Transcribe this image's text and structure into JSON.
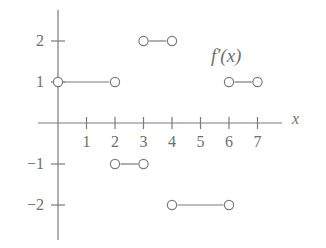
{
  "figure": {
    "background_color": "#ffffff",
    "ink_color": "#7a7a7a",
    "text_color": "#6e6e6e",
    "function_label": "f′(x)",
    "xaxis_label": "x"
  },
  "chart_data": {
    "type": "line",
    "title": "",
    "subtitle": "",
    "xlabel": "x",
    "ylabel": "",
    "legend": [
      "f′(x)"
    ],
    "legend_position": "upper-right-inside",
    "grid": false,
    "xlim": [
      -0.7,
      7.9
    ],
    "ylim": [
      -2.75,
      2.75
    ],
    "xticks": [
      1,
      2,
      3,
      4,
      5,
      6,
      7
    ],
    "xtick_labels": [
      "1",
      "2",
      "3",
      "4",
      "5",
      "6",
      "7"
    ],
    "yticks": [
      2,
      1,
      -1,
      -2
    ],
    "ytick_labels": [
      "2",
      "1",
      "-1",
      "-2"
    ],
    "series": [
      {
        "name": "f'(x)",
        "style": "step-segments-open-endpoints",
        "segments": [
          {
            "x0": 0,
            "x1": 2,
            "y": 1,
            "endpoint_left": "open",
            "endpoint_right": "open"
          },
          {
            "x0": 3,
            "x1": 4,
            "y": 2,
            "endpoint_left": "open",
            "endpoint_right": "open"
          },
          {
            "x0": 6,
            "x1": 7,
            "y": 1,
            "endpoint_left": "open",
            "endpoint_right": "open"
          },
          {
            "x0": 2,
            "x1": 3,
            "y": -1,
            "endpoint_left": "open",
            "endpoint_right": "open"
          },
          {
            "x0": 4,
            "x1": 6,
            "y": -2,
            "endpoint_left": "open",
            "endpoint_right": "open"
          }
        ]
      }
    ],
    "annotations": [
      {
        "text": "f′(x)",
        "x": 5.9,
        "y": 1.65
      }
    ]
  },
  "geometry": {
    "origin_px": {
      "x": 58,
      "y": 123
    },
    "unit_px": {
      "x": 28.5,
      "y": 41
    },
    "xaxis_px": {
      "x_start": 38,
      "x_end": 282
    },
    "yaxis_px": {
      "y_start": 10,
      "y_end": 240
    },
    "marker_radius_px": 4.6,
    "stroke_width_px": 1.2
  }
}
